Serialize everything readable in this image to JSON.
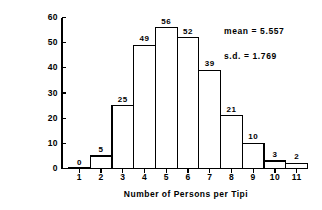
{
  "chart_data": {
    "type": "bar",
    "title": "",
    "xlabel": "Number of Persons per Tipi",
    "ylabel": "Number of Tipis",
    "categories": [
      "1",
      "2",
      "3",
      "4",
      "5",
      "6",
      "7",
      "8",
      "9",
      "10",
      "11"
    ],
    "values": [
      0,
      5,
      25,
      49,
      56,
      52,
      39,
      21,
      10,
      3,
      2
    ],
    "value_labels": [
      "0",
      "5",
      "25",
      "49",
      "56",
      "52",
      "39",
      "21",
      "10",
      "3",
      "2"
    ],
    "xlim": [
      0.5,
      11.5
    ],
    "ylim": [
      0,
      60
    ],
    "yticks": [
      0,
      10,
      20,
      30,
      40,
      50,
      60
    ],
    "ytick_labels": [
      "0",
      "10",
      "20",
      "30",
      "40",
      "50",
      "60"
    ],
    "grid": false,
    "legend": null,
    "bar_fill": "#ffffff",
    "bar_edge": "#000000",
    "axis_color": "#000000",
    "background": "#ffffff",
    "annotations": [
      {
        "id": "mean",
        "text": "mean  =  5.557"
      },
      {
        "id": "sd",
        "text": "s.d.  =  1.769"
      }
    ]
  }
}
